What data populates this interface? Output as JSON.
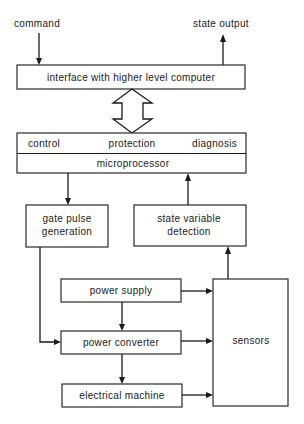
{
  "diagram": {
    "inputs": {
      "command": "command",
      "state_output": "state output"
    },
    "interface": {
      "label": "interface with higher level computer"
    },
    "microprocessor": {
      "functions": [
        "control",
        "protection",
        "diagnosis"
      ],
      "label": "microprocessor"
    },
    "gate_pulse": {
      "line1": "gate pulse",
      "line2": "generation"
    },
    "state_variable": {
      "line1": "state variable",
      "line2": "detection"
    },
    "power_supply": {
      "label": "power supply"
    },
    "power_converter": {
      "label": "power converter"
    },
    "electrical_machine": {
      "label": "electrical machine"
    },
    "sensors": {
      "label": "sensors"
    },
    "edges": [
      {
        "from": "command",
        "to": "interface"
      },
      {
        "from": "interface",
        "to": "state output"
      },
      {
        "from": "interface",
        "to": "microprocessor",
        "type": "bidirectional"
      },
      {
        "from": "microprocessor",
        "to": "gate pulse generation"
      },
      {
        "from": "state variable detection",
        "to": "microprocessor"
      },
      {
        "from": "gate pulse generation",
        "to": "power converter"
      },
      {
        "from": "power supply",
        "to": "power converter"
      },
      {
        "from": "power converter",
        "to": "electrical machine"
      },
      {
        "from": "power supply",
        "to": "sensors"
      },
      {
        "from": "power converter",
        "to": "sensors"
      },
      {
        "from": "electrical machine",
        "to": "sensors"
      },
      {
        "from": "sensors",
        "to": "state variable detection"
      }
    ]
  }
}
